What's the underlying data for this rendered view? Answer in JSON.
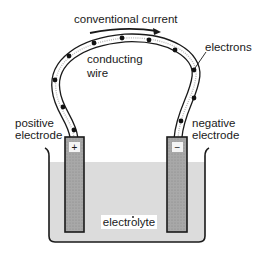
{
  "diagram": {
    "labels": {
      "conventional_current": "conventional current",
      "conducting_wire_line1": "conducting",
      "conducting_wire_line2": "wire",
      "electrons": "electrons",
      "positive_electrode_line1": "positive",
      "positive_electrode_line2": "electrode",
      "negative_electrode_line1": "negative",
      "negative_electrode_line2": "electrode",
      "electrolyte": "electrolyte",
      "plus_sign": "+",
      "minus_sign": "−"
    },
    "colors": {
      "stroke": "#1a1a1a",
      "electrode_fill": "#a8a8a8",
      "electrolyte_fill": "#dcdcdc",
      "wire_fill": "#ffffff",
      "electron_dot": "#111111"
    },
    "icons": {
      "current_arrow": "arrow-right-curved",
      "electron": "filled-dot"
    }
  }
}
